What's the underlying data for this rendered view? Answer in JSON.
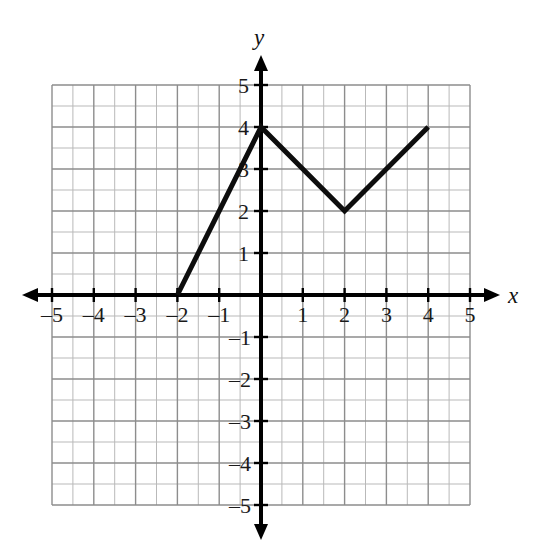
{
  "figure": {
    "kind": "coordinate-plane-graph",
    "background_color": "#ffffff",
    "axis_color": "#000000",
    "grid_minor_color": "#b9b9b9",
    "grid_major_color": "#8d8d8d",
    "curve_color": "#0d0d0d"
  },
  "axes": {
    "x_axis_label": "x",
    "y_axis_label": "y",
    "x_tick_labels": [
      "–5",
      "–4",
      "–3",
      "–2",
      "–1",
      "1",
      "2",
      "3",
      "4",
      "5"
    ],
    "y_tick_labels": [
      "5",
      "4",
      "3",
      "2",
      "1",
      "–1",
      "–2",
      "–3",
      "–4",
      "–5"
    ],
    "x_tick_values": [
      -5,
      -4,
      -3,
      -2,
      -1,
      1,
      2,
      3,
      4,
      5
    ],
    "y_tick_values": [
      5,
      4,
      3,
      2,
      1,
      -1,
      -2,
      -3,
      -4,
      -5
    ]
  },
  "chart_data": {
    "type": "line",
    "title": "",
    "xlabel": "x",
    "ylabel": "y",
    "xlim": [
      -5,
      5
    ],
    "ylim": [
      -5,
      5
    ],
    "xticks": [
      -5,
      -4,
      -3,
      -2,
      -1,
      0,
      1,
      2,
      3,
      4,
      5
    ],
    "yticks": [
      -5,
      -4,
      -3,
      -2,
      -1,
      0,
      1,
      2,
      3,
      4,
      5
    ],
    "grid": true,
    "grid_minor_step": 0.5,
    "legend": "none",
    "series": [
      {
        "name": "piecewise-linear function",
        "x": [
          -2,
          0,
          2,
          4
        ],
        "y": [
          0,
          4,
          2,
          4
        ],
        "points": [
          [
            -2,
            0
          ],
          [
            0,
            4
          ],
          [
            2,
            2
          ],
          [
            4,
            4
          ]
        ],
        "line_width_px": 5,
        "color": "#0d0d0d",
        "closed": false,
        "markers": "none"
      }
    ],
    "annotations": []
  }
}
